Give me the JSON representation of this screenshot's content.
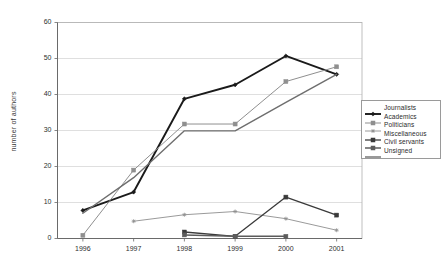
{
  "chart_data": {
    "type": "line",
    "title": "",
    "xlabel": "",
    "ylabel": "number of authors",
    "categories": [
      "1996",
      "1997",
      "1998",
      "1999",
      "2000",
      "2001"
    ],
    "ylim": [
      0,
      60
    ],
    "ytick_step": 10,
    "yticks": [
      "0",
      "10",
      "20",
      "30",
      "40",
      "50",
      "60"
    ],
    "grid": "horizontal",
    "legend_position": "right",
    "series": [
      {
        "name": "Journalists",
        "color": "#1a1a1a",
        "marker": "diamond",
        "width": 1.9,
        "values": [
          7.8,
          12.9,
          38.8,
          42.7,
          50.7,
          45.6
        ]
      },
      {
        "name": "Academics",
        "color": "#8f8f8f",
        "marker": "square",
        "width": 1.0,
        "values": [
          0.9,
          19.0,
          31.8,
          31.8,
          43.6,
          47.7
        ]
      },
      {
        "name": "Politicians",
        "color": "#8f8f8f",
        "marker": "star",
        "width": 0.9,
        "values": [
          null,
          4.8,
          6.6,
          7.5,
          5.5,
          2.3
        ]
      },
      {
        "name": "Miscellaneous",
        "color": "#3a3a3a",
        "marker": "square-filled",
        "width": 1.3,
        "values": [
          null,
          null,
          1.8,
          0.6,
          11.5,
          6.5
        ]
      },
      {
        "name": "Civil servants",
        "color": "#5c5c5c",
        "marker": "square-filled",
        "width": 1.5,
        "values": [
          null,
          null,
          1.0,
          0.6,
          0.6,
          null
        ]
      },
      {
        "name": "Unsigned",
        "color": "#6e6e6e",
        "marker": "none",
        "width": 1.4,
        "values": [
          7.0,
          16.9,
          29.9,
          29.9,
          37.8,
          45.6
        ]
      }
    ]
  },
  "legend": {
    "items": [
      {
        "label": "Journalists"
      },
      {
        "label": "Academics"
      },
      {
        "label": "Politicians"
      },
      {
        "label": "Miscellaneous"
      },
      {
        "label": "Civil servants"
      },
      {
        "label": "Unsigned"
      }
    ]
  }
}
